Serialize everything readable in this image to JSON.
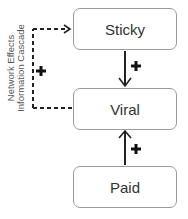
{
  "nodes": {
    "sticky": "Sticky",
    "viral": "Viral",
    "paid": "Paid"
  },
  "edges": [
    {
      "from": "Sticky",
      "to": "Viral",
      "sign": "+",
      "style": "solid"
    },
    {
      "from": "Paid",
      "to": "Viral",
      "sign": "+",
      "style": "solid"
    },
    {
      "from": "Viral",
      "to": "Sticky",
      "sign": "+",
      "style": "dashed"
    }
  ],
  "feedback_label": {
    "line1": "Network Effects",
    "line2": "Information Cascade"
  },
  "signs": {
    "plus": "+"
  }
}
